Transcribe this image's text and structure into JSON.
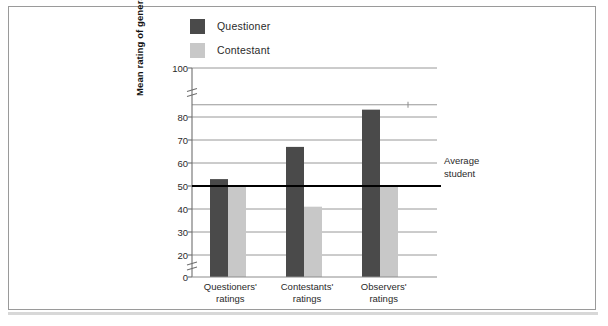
{
  "chart_data": {
    "type": "bar",
    "title": "",
    "subtitle": "",
    "xlabel": "",
    "ylabel": "Mean rating of general knowledge",
    "categories": [
      "Questioners'\nratings",
      "Contestants'\nratings",
      "Observers'\nratings"
    ],
    "category_lines": [
      [
        "Questioners'",
        "ratings"
      ],
      [
        "Contestants'",
        "ratings"
      ],
      [
        "Observers'",
        "ratings"
      ]
    ],
    "series": [
      {
        "name": "Questioner",
        "color": "#4a4a4a",
        "values": [
          53,
          67,
          83
        ]
      },
      {
        "name": "Contestant",
        "color": "#c8c8c8",
        "values": [
          50,
          41,
          50
        ]
      }
    ],
    "ylim": [
      0,
      100
    ],
    "yticks": [
      0,
      20,
      30,
      40,
      50,
      60,
      70,
      80,
      100
    ],
    "ytick_labels": [
      "0",
      "20",
      "30",
      "40",
      "50",
      "60",
      "70",
      "80",
      "100"
    ],
    "axis_breaks": [
      [
        0,
        20
      ],
      [
        80,
        100
      ]
    ],
    "grid": true,
    "grid_axis": "y",
    "legend_position": "top-left",
    "annotations": [
      {
        "name": "average-student-reference",
        "type": "hline",
        "value": 50,
        "label_line_1": "Average",
        "label_line_2": "student",
        "color": "#000000"
      }
    ]
  },
  "legend": {
    "items": [
      {
        "label": "Questioner",
        "color": "#4a4a4a"
      },
      {
        "label": "Contestant",
        "color": "#c8c8c8"
      }
    ]
  },
  "axis": {
    "y_title": "Mean rating of general knowledge",
    "tick_labels": [
      "100",
      "80",
      "70",
      "60",
      "50",
      "40",
      "30",
      "20",
      "0"
    ]
  },
  "annotation": {
    "line1": "Average",
    "line2": "student"
  },
  "colors": {
    "questioner": "#4a4a4a",
    "contestant": "#c8c8c8",
    "grid": "#8c8c8c",
    "axis": "#6f6f6f",
    "reference_line": "#000000",
    "frame": "#9a9a9a"
  }
}
